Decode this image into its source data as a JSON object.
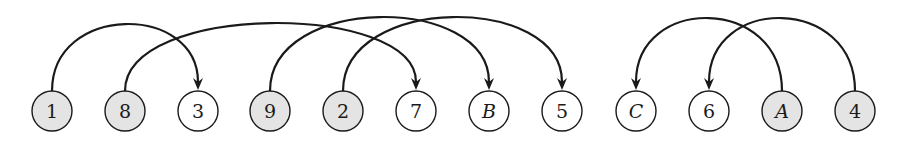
{
  "diagram": {
    "type": "arc-permutation-diagram",
    "node_center_y": 111,
    "node_radius": 20,
    "colors": {
      "shaded_fill": "#e4e4e4",
      "unshaded_fill": "#ffffff",
      "stroke": "#1a1a1a"
    },
    "nodes": [
      {
        "label": "1",
        "x": 52,
        "shaded": true,
        "italic": false
      },
      {
        "label": "8",
        "x": 125,
        "shaded": true,
        "italic": false
      },
      {
        "label": "3",
        "x": 198,
        "shaded": false,
        "italic": false
      },
      {
        "label": "9",
        "x": 270,
        "shaded": true,
        "italic": false
      },
      {
        "label": "2",
        "x": 343,
        "shaded": true,
        "italic": false
      },
      {
        "label": "7",
        "x": 416,
        "shaded": false,
        "italic": false
      },
      {
        "label": "B",
        "x": 489,
        "shaded": false,
        "italic": true
      },
      {
        "label": "5",
        "x": 562,
        "shaded": false,
        "italic": false
      },
      {
        "label": "C",
        "x": 636,
        "shaded": false,
        "italic": true
      },
      {
        "label": "6",
        "x": 709,
        "shaded": false,
        "italic": false
      },
      {
        "label": "A",
        "x": 782,
        "shaded": true,
        "italic": true
      },
      {
        "label": "4",
        "x": 855,
        "shaded": true,
        "italic": false
      }
    ],
    "arcs": [
      {
        "from": "1",
        "to": "3",
        "top_y": 25
      },
      {
        "from": "8",
        "to": "7",
        "top_y": 24
      },
      {
        "from": "9",
        "to": "B",
        "top_y": 18
      },
      {
        "from": "2",
        "to": "5",
        "top_y": 18
      },
      {
        "from": "A",
        "to": "C",
        "top_y": 19
      },
      {
        "from": "4",
        "to": "6",
        "top_y": 19
      }
    ]
  }
}
